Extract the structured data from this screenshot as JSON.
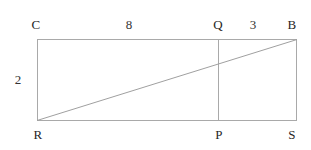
{
  "figure": {
    "type": "geometry-diagram",
    "background_color": "#ffffff",
    "stroke_color": "#a9a9a9",
    "text_color": "#262626",
    "stroke_width": 1,
    "canvas": {
      "width": 311,
      "height": 150
    },
    "rectangle": {
      "left": 37,
      "top": 39,
      "right": 297,
      "bottom": 121
    },
    "vertices": {
      "C": {
        "x": 37,
        "y": 39
      },
      "B": {
        "x": 297,
        "y": 39
      },
      "S": {
        "x": 297,
        "y": 121
      },
      "R": {
        "x": 37,
        "y": 121
      },
      "Q": {
        "x": 218,
        "y": 39
      },
      "P": {
        "x": 218,
        "y": 121
      }
    },
    "segments": [
      {
        "name": "top-edge-CB",
        "x1": 37,
        "y1": 39,
        "x2": 297,
        "y2": 39
      },
      {
        "name": "right-edge-BS",
        "x1": 297,
        "y1": 39,
        "x2": 297,
        "y2": 121
      },
      {
        "name": "bottom-edge-SR",
        "x1": 297,
        "y1": 121,
        "x2": 37,
        "y2": 121
      },
      {
        "name": "left-edge-RC",
        "x1": 37,
        "y1": 121,
        "x2": 37,
        "y2": 39
      },
      {
        "name": "vertical-divider-QP",
        "x1": 218,
        "y1": 39,
        "x2": 218,
        "y2": 121
      },
      {
        "name": "diagonal-RB",
        "x1": 37,
        "y1": 121,
        "x2": 297,
        "y2": 39
      }
    ],
    "labels": [
      {
        "id": "vertex-C",
        "text": "C",
        "x": 36,
        "y": 24,
        "kind": "vertex"
      },
      {
        "id": "length-CQ",
        "text": "8",
        "x": 129,
        "y": 24,
        "kind": "measure"
      },
      {
        "id": "vertex-Q",
        "text": "Q",
        "x": 218,
        "y": 24,
        "kind": "vertex"
      },
      {
        "id": "length-QB",
        "text": "3",
        "x": 253,
        "y": 24,
        "kind": "measure"
      },
      {
        "id": "vertex-B",
        "text": "B",
        "x": 292,
        "y": 24,
        "kind": "vertex"
      },
      {
        "id": "length-RC",
        "text": "2",
        "x": 18,
        "y": 79,
        "kind": "measure"
      },
      {
        "id": "vertex-R",
        "text": "R",
        "x": 38,
        "y": 134,
        "kind": "vertex"
      },
      {
        "id": "vertex-P",
        "text": "P",
        "x": 219,
        "y": 134,
        "kind": "vertex"
      },
      {
        "id": "vertex-S",
        "text": "S",
        "x": 292,
        "y": 134,
        "kind": "vertex"
      }
    ]
  }
}
